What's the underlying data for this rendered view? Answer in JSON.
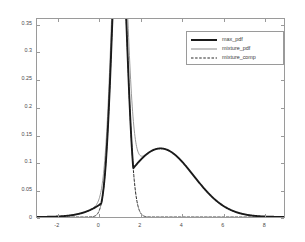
{
  "chart_data": {
    "type": "line",
    "title": "",
    "xlabel": "",
    "ylabel": "",
    "xlim": [
      -3,
      9
    ],
    "ylim": [
      0,
      0.36
    ],
    "xticks": [
      -2,
      0,
      2,
      4,
      6,
      8
    ],
    "xticklabels": [
      "-2",
      "0",
      "2",
      "4",
      "6",
      "8"
    ],
    "yticks": [
      0,
      0.05,
      0.1,
      0.15,
      0.2,
      0.25,
      0.3,
      0.35
    ],
    "yticklabels": [
      "0",
      "0.05",
      "0.1",
      "0.15",
      "0.2",
      "0.25",
      "0.3",
      "0.35"
    ],
    "grid": false,
    "legend_position": "upper right",
    "components": {
      "narrow": {
        "mean": 1.0,
        "sigma": 0.35,
        "weight": 0.5
      },
      "broad": {
        "mean": 3.0,
        "sigma": 1.6,
        "weight": 0.5
      }
    },
    "series": [
      {
        "name": "max_pdf",
        "color": "#1a1a1a",
        "linewidth": 1.9,
        "linestyle": "solid",
        "x": [
          -3.0,
          -2.6,
          -2.2,
          -1.8,
          -1.4,
          -1.0,
          -0.6,
          -0.2,
          0.2,
          0.4,
          0.6,
          0.8,
          0.9,
          1.0,
          1.1,
          1.2,
          1.4,
          1.6,
          1.8,
          2.0,
          2.2,
          2.6,
          3.0,
          3.4,
          3.8,
          4.2,
          4.6,
          5.0,
          5.4,
          5.8,
          6.2,
          6.6,
          7.0,
          7.4,
          7.8,
          8.2,
          8.6,
          9.0
        ],
        "y": [
          0.0002,
          0.0006,
          0.0015,
          0.0033,
          0.0067,
          0.0127,
          0.0223,
          0.0362,
          0.0545,
          0.0906,
          0.1707,
          0.2348,
          0.2501,
          0.2533,
          0.2501,
          0.2348,
          0.1322,
          0.1466,
          0.1596,
          0.1707,
          0.1794,
          0.1855,
          0.1865,
          0.1855,
          0.1794,
          0.1707,
          0.1596,
          0.1466,
          0.1322,
          0.1171,
          0.1018,
          0.0869,
          0.0728,
          0.0599,
          0.0483,
          0.0383,
          0.0298,
          0.0228
        ]
      },
      {
        "name": "mixture_pdf",
        "color": "#8c8c8c",
        "linewidth": 0.9,
        "linestyle": "solid",
        "x": [
          -3.0,
          -2.6,
          -2.2,
          -1.8,
          -1.4,
          -1.0,
          -0.6,
          -0.2,
          0.2,
          0.4,
          0.6,
          0.8,
          0.9,
          1.0,
          1.1,
          1.2,
          1.4,
          1.6,
          1.8,
          2.0,
          2.2,
          2.6,
          3.0,
          3.4,
          3.8,
          4.2,
          4.6,
          5.0,
          5.4,
          5.8,
          6.2,
          6.6,
          7.0,
          7.4,
          7.8,
          8.2,
          8.6,
          9.0
        ],
        "y": [
          0.0002,
          0.0006,
          0.0015,
          0.0033,
          0.0067,
          0.0127,
          0.0223,
          0.0369,
          0.0674,
          0.107,
          0.2009,
          0.3132,
          0.339,
          0.3473,
          0.339,
          0.3132,
          0.2228,
          0.1773,
          0.1684,
          0.1717,
          0.1796,
          0.1855,
          0.1865,
          0.1855,
          0.1794,
          0.1707,
          0.1596,
          0.1466,
          0.1322,
          0.1171,
          0.1018,
          0.0869,
          0.0728,
          0.0599,
          0.0483,
          0.0383,
          0.0298,
          0.0228
        ]
      },
      {
        "name": "mixture_comp",
        "color": "#2a2a2a",
        "linewidth": 1.0,
        "linestyle": "dashed",
        "x": [
          -0.3,
          -0.1,
          0.1,
          0.3,
          0.5,
          0.7,
          0.9,
          1.0,
          1.1,
          1.3,
          1.5,
          1.7,
          1.9,
          2.1,
          2.3,
          2.6,
          3.0,
          4.0,
          5.0,
          6.0,
          7.0,
          8.0,
          9.0
        ],
        "y": [
          0.0003,
          0.0021,
          0.0106,
          0.0384,
          0.0988,
          0.1813,
          0.237,
          0.2443,
          0.237,
          0.1813,
          0.0988,
          0.0384,
          0.0106,
          0.0021,
          0.0003,
          1e-05,
          0.0,
          0.0,
          0.0,
          0.0,
          0.0,
          0.0,
          0.0
        ]
      }
    ]
  },
  "legend": {
    "entries": [
      {
        "label": "max_pdf"
      },
      {
        "label": "mixture_pdf"
      },
      {
        "label": "mixture_comp"
      }
    ]
  }
}
